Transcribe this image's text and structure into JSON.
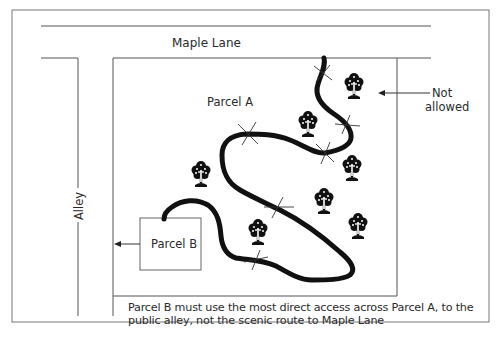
{
  "labels": {
    "street": "Maple Lane",
    "alley": "Alley",
    "parcel_a": "Parcel A",
    "parcel_b": "Parcel B",
    "not_allowed_line1": "Not",
    "not_allowed_line2": "allowed"
  },
  "caption": "Parcel B must use the most direct access across Parcel A, to the public alley, not the scenic route to Maple Lane",
  "icons": {
    "tree": "tree-icon",
    "crossing_mark": "x-mark-icon",
    "arrow": "arrow-left-icon"
  },
  "tree_count": 7,
  "crossing_count": 6
}
